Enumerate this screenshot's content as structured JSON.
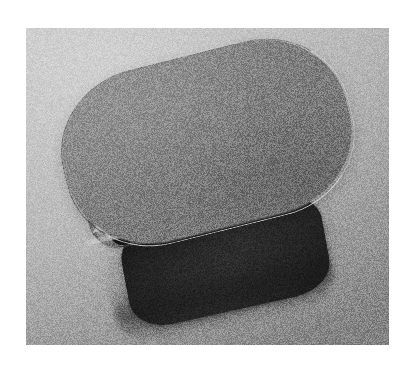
{
  "image": {
    "kind": "3d-render",
    "subject": "oblong-stadium-container-with-cylinders",
    "color_mode": "grayscale",
    "noise": "heavy-film-grain",
    "frame": {
      "outer_background": "#ffffff",
      "content_left": 26,
      "content_top": 28,
      "content_width": 363,
      "content_height": 317
    }
  },
  "scene": {
    "background": {
      "name": "ground-plane",
      "light_tone": "#d6d6d6",
      "dark_tone": "#9c9c9c",
      "gradient_direction": "top-left-light-to-bottom-right-dark"
    },
    "lid": {
      "name": "stadium-lid",
      "shape": "stadium",
      "fill_light": "#9b9b9b",
      "fill_dark": "#7d7d7d",
      "rotation_deg": -14,
      "rim_highlight": "#f0f0f0",
      "outline": "#3c3c3c"
    },
    "body": {
      "name": "container-wall",
      "shape": "rounded-rectangle",
      "fill_light": "#323232",
      "fill_dark": "#1d1d1d",
      "rotation_deg": -12.5
    },
    "mouth": {
      "name": "open-slot",
      "fill_light": "#9e9e9e",
      "fill_dark": "#6f6f6f",
      "lip_highlight": "#fafafa"
    },
    "shadow": {
      "name": "cast-shadow",
      "tone": "#191919",
      "opacity": 0.42
    },
    "items": {
      "name": "cylinder-row",
      "count": 5,
      "barrel_light": "#e3e3e3",
      "barrel_dark": "#7e7e7e",
      "face_light": "#4a4a4a",
      "face_dark": "#1a1a1a",
      "wedge_color": "#ffffff",
      "list": [
        {
          "label": "cylinder-1",
          "x": 4,
          "y": 24,
          "size": 40,
          "wedge": true,
          "speck": false
        },
        {
          "label": "cylinder-2",
          "x": 38,
          "y": 18,
          "size": 42,
          "wedge": true,
          "speck": false
        },
        {
          "label": "cylinder-3",
          "x": 74,
          "y": 11,
          "size": 44,
          "wedge": true,
          "speck": true
        },
        {
          "label": "cylinder-4",
          "x": 112,
          "y": 6,
          "size": 43,
          "wedge": true,
          "speck": false
        },
        {
          "label": "cylinder-5",
          "x": 150,
          "y": 2,
          "size": 42,
          "wedge": false,
          "speck": false
        }
      ]
    }
  }
}
